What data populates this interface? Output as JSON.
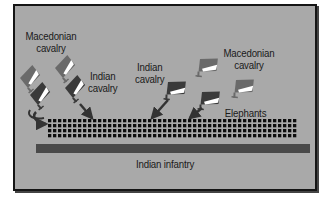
{
  "diagram": {
    "labels": {
      "macedonian_cavalry_left": [
        "Macedonian",
        "cavalry"
      ],
      "indian_cavalry_left": [
        "Indian",
        "cavalry"
      ],
      "indian_cavalry_center": [
        "Indian",
        "cavalry"
      ],
      "macedonian_cavalry_right": [
        "Macedonian",
        "cavalry"
      ],
      "elephants": "Elephants",
      "indian_infantry": "Indian infantry"
    },
    "colors": {
      "background": "#a9a9a9",
      "frame_border": "#151515",
      "infantry_bar": "#4a4a4a",
      "elephant_square": "#0d0d0d",
      "unit_dark": "#3a3a3a",
      "unit_mid": "#666666",
      "unit_light": "#ffffff",
      "text": "#1a1a1a"
    },
    "elephant_grid": {
      "rows": 4,
      "cols": 50
    }
  }
}
